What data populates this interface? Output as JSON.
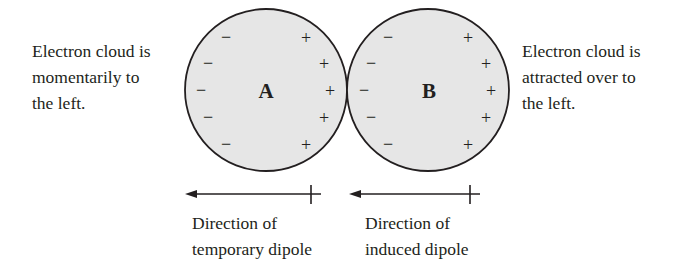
{
  "left_caption": {
    "lines": [
      "Electron cloud is",
      "momentarily to",
      "the left."
    ]
  },
  "right_caption": {
    "lines": [
      "Electron cloud is",
      "attracted over to",
      "the left."
    ]
  },
  "atoms": [
    {
      "label": "A",
      "fill": "#e6e6e6",
      "stroke": "#231f20"
    },
    {
      "label": "B",
      "fill": "#e6e6e6",
      "stroke": "#231f20"
    }
  ],
  "charges": {
    "negative": "−",
    "positive": "+"
  },
  "arrows": [
    {
      "caption_lines": [
        "Direction of",
        "temporary dipole"
      ]
    },
    {
      "caption_lines": [
        "Direction of",
        "induced dipole"
      ]
    }
  ]
}
